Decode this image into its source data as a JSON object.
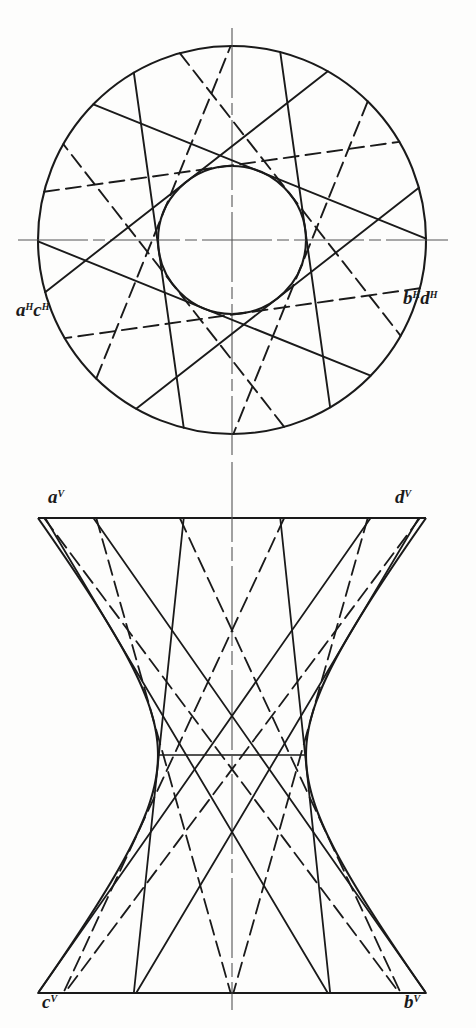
{
  "figure": {
    "kind": "descriptive-geometry-drawing",
    "views": [
      {
        "id": "top",
        "name": "top-view-plan-H",
        "projection": "H"
      },
      {
        "id": "front",
        "name": "front-view-elevation-V",
        "projection": "V"
      }
    ]
  },
  "labels": {
    "top_left": {
      "letters": "a",
      "sup1": "H",
      "letters2": "c",
      "sup2": "H",
      "full": "aHcH"
    },
    "top_right": {
      "letters": "b",
      "sup1": "H",
      "letters2": "d",
      "sup2": "H",
      "full": "bHdH"
    },
    "front_top_left": {
      "letters": "a",
      "sup1": "V",
      "full": "aV"
    },
    "front_top_right": {
      "letters": "d",
      "sup1": "V",
      "full": "dV"
    },
    "front_bottom_left": {
      "letters": "c",
      "sup1": "V",
      "full": "cV"
    },
    "front_bottom_right": {
      "letters": "b",
      "sup1": "V",
      "full": "bV"
    }
  },
  "colors": {
    "ink": "#1a1a1a",
    "paper": "#fdfdfc",
    "centerline": "#555555"
  },
  "geometry": {
    "top_view": {
      "center_x": 232,
      "center_y": 240,
      "outer_radius": 194,
      "inner_radius": 74,
      "num_elements": 12,
      "element_start_angle_deg": -8,
      "chord_half_angle_deg": 67.6
    },
    "front_view": {
      "left_x": 38,
      "right_x": 426,
      "top_y": 518,
      "bottom_y": 993,
      "throat_y": 755,
      "throat_left_x": 158,
      "throat_right_x": 306,
      "axis_x": 232,
      "num_elements": 12
    },
    "center_axis": {
      "x": 232,
      "top_y": 28,
      "bottom_y": 455,
      "front_top_y": 462,
      "front_bottom_y": 1010
    },
    "horizontal_centerline": {
      "y": 240,
      "x1": 18,
      "x2": 448
    }
  }
}
